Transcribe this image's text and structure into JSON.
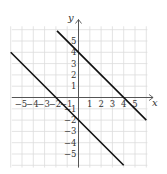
{
  "chart_data": {
    "type": "line",
    "title": "",
    "xlabel": "x",
    "ylabel": "y",
    "xlim": [
      -6,
      6
    ],
    "ylim": [
      -6,
      6
    ],
    "grid": true,
    "x_ticks": [
      -5,
      -4,
      -3,
      -2,
      -1,
      1,
      2,
      3,
      4,
      5
    ],
    "y_ticks": [
      -5,
      -4,
      -3,
      -2,
      -1,
      1,
      2,
      3,
      4,
      5
    ],
    "series": [
      {
        "name": "y = -x + 4",
        "x": [
          -1.9,
          6
        ],
        "y": [
          5.9,
          -2
        ],
        "points_of_interest": [
          [
            0,
            4
          ],
          [
            4,
            0
          ]
        ]
      },
      {
        "name": "y = -x - 2",
        "x": [
          -6,
          4
        ],
        "y": [
          4,
          -6
        ],
        "points_of_interest": [
          [
            -2,
            0
          ],
          [
            0,
            -2
          ]
        ]
      }
    ],
    "colors": {
      "grid": "#dcdcdc",
      "axis": "#555555",
      "line": "#111111"
    }
  },
  "axes": {
    "x_label": "x",
    "y_label": "y"
  }
}
